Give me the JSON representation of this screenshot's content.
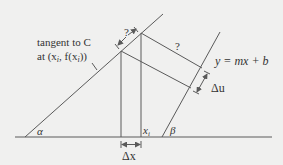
{
  "diagram": {
    "background": "#f0f0ef",
    "line_color": "#5a5a5a",
    "labels": {
      "tangent_line1": "tangent to C",
      "tangent_line2": "at (x",
      "tangent_sub1": "i",
      "tangent_mid": ", f(x",
      "tangent_sub2": "i",
      "tangent_end": "))",
      "question_top": "?",
      "question_right": "?",
      "line_eq": "y = mx + b",
      "delta_u": "Δu",
      "delta_x": "Δx",
      "x_i": "x",
      "x_i_sub": "i",
      "alpha": "α",
      "beta": "β"
    }
  }
}
